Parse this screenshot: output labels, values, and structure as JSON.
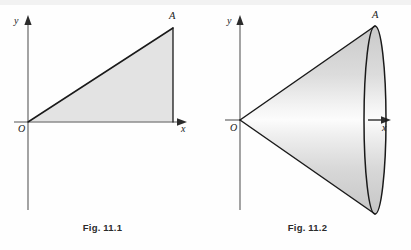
{
  "page": {
    "width": 411,
    "height": 250,
    "background": "#fefefe"
  },
  "figures": [
    {
      "id": "fig-11-1",
      "caption": "Fig. 11.1",
      "description": "right triangle region under a line through the origin",
      "axes": {
        "x_label": "x",
        "y_label": "y",
        "origin_label": "O"
      },
      "points": [
        {
          "name": "A",
          "label": "A"
        }
      ],
      "colors": {
        "fill": "#e3e3e3",
        "stroke": "#1a1a1a",
        "axis": "#8d8d8d"
      }
    },
    {
      "id": "fig-11-2",
      "caption": "Fig. 11.2",
      "description": "cone of revolution generated by rotating the triangle about the x-axis",
      "axes": {
        "x_label": "x",
        "y_label": "y",
        "origin_label": "O"
      },
      "points": [
        {
          "name": "A",
          "label": "A"
        }
      ],
      "colors": {
        "fill_dark": "#d2d2d2",
        "fill_light": "#fbfbfb",
        "stroke": "#1a1a1a",
        "axis": "#8d8d8d"
      }
    }
  ]
}
